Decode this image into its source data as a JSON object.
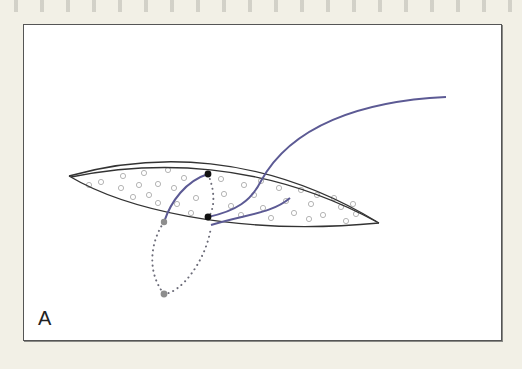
{
  "figure": {
    "panel_label": "A",
    "colors": {
      "background": "#f2f0e6",
      "panel": "#ffffff",
      "outline": "#333333",
      "suture": "#5c5a94",
      "dotted": "#6b6b78",
      "knot_black": "#111111",
      "knot_gray": "#8d8d8d",
      "texture_circles": "#b5b5b5"
    },
    "elements": [
      {
        "name": "wound-lens-outline",
        "description": "double-edged lens shaped incision"
      },
      {
        "name": "long-suture-tail",
        "description": "purple thread exiting upward to the right"
      },
      {
        "name": "short-suture-tail",
        "description": "short purple thread inside lens"
      },
      {
        "name": "left-suture-arc",
        "description": "purple thread from gray dot to upper black dot"
      },
      {
        "name": "dotted-loop",
        "description": "dotted thread path beneath tissue"
      },
      {
        "name": "black-knot-upper"
      },
      {
        "name": "black-knot-lower"
      },
      {
        "name": "gray-entry-point-upper"
      },
      {
        "name": "gray-entry-point-lower"
      }
    ]
  }
}
